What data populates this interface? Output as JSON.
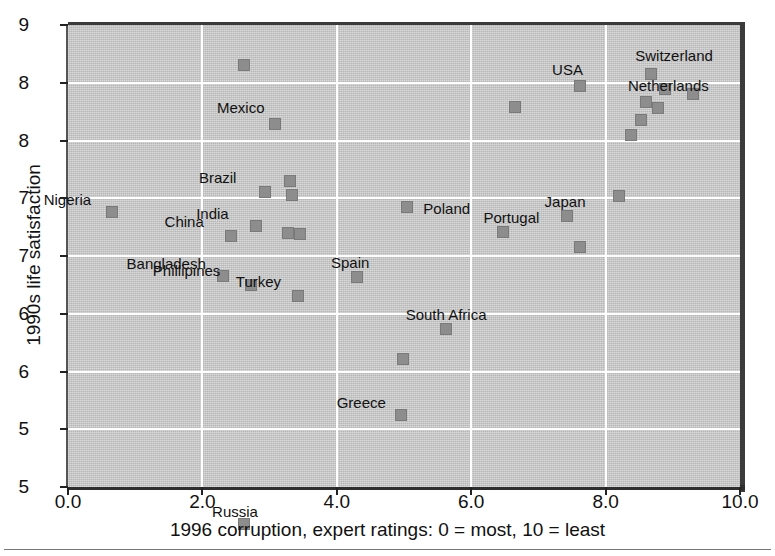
{
  "chart_data": {
    "type": "scatter",
    "title": "",
    "xlabel": "1996 corruption, expert ratings: 0 = most, 10 = least",
    "ylabel": "1990s life satisfaction",
    "xlim": [
      0.0,
      10.0
    ],
    "ylim": [
      5.0,
      9.0
    ],
    "grid": true,
    "legend": "none",
    "xticks": [
      "0.0",
      "2.0",
      "4.0",
      "6.0",
      "8.0",
      "10.0"
    ],
    "xtick_values": [
      0.0,
      2.0,
      4.0,
      6.0,
      8.0,
      10.0
    ],
    "yticks": [
      "9",
      "8",
      "8",
      "7",
      "7",
      "6",
      "6",
      "5",
      "5"
    ],
    "ytick_values": [
      9.0,
      8.5,
      8.0,
      7.5,
      7.0,
      6.5,
      6.0,
      5.5,
      5.0
    ],
    "marker_color": "#8d8d8d",
    "plot_background": "#c4c4c4",
    "gridline_color": "#ffffff",
    "points": [
      {
        "label": "Nigeria",
        "x": 0.65,
        "y": 7.38,
        "label_dx": -68,
        "label_dy": -20
      },
      {
        "label": "Bangladesh",
        "x": 2.3,
        "y": 6.83,
        "label_dx": -96,
        "label_dy": -20
      },
      {
        "label": "China",
        "x": 2.42,
        "y": 7.17,
        "label_dx": -66,
        "label_dy": -22
      },
      {
        "label": "",
        "x": 2.62,
        "y": 8.65,
        "label_dx": 0,
        "label_dy": 0
      },
      {
        "label": "Russia",
        "x": 2.62,
        "y": 4.68,
        "label_dx": -32,
        "label_dy": -20
      },
      {
        "label": "Phillipines",
        "x": 2.72,
        "y": 6.75,
        "label_dx": -98,
        "label_dy": -22
      },
      {
        "label": "India",
        "x": 2.8,
        "y": 7.26,
        "label_dx": -60,
        "label_dy": -20
      },
      {
        "label": "Brazil",
        "x": 2.93,
        "y": 7.55,
        "label_dx": -66,
        "label_dy": -22
      },
      {
        "label": "Mexico",
        "x": 3.08,
        "y": 8.14,
        "label_dx": -58,
        "label_dy": -24
      },
      {
        "label": "",
        "x": 3.28,
        "y": 7.2,
        "label_dx": 0,
        "label_dy": 0
      },
      {
        "label": "",
        "x": 3.3,
        "y": 7.65,
        "label_dx": 0,
        "label_dy": 0
      },
      {
        "label": "",
        "x": 3.33,
        "y": 7.53,
        "label_dx": 0,
        "label_dy": 0
      },
      {
        "label": "Turkey",
        "x": 3.42,
        "y": 6.65,
        "label_dx": -62,
        "label_dy": -22
      },
      {
        "label": "",
        "x": 3.45,
        "y": 7.19,
        "label_dx": 0,
        "label_dy": 0
      },
      {
        "label": "Spain",
        "x": 4.3,
        "y": 6.82,
        "label_dx": -26,
        "label_dy": -22
      },
      {
        "label": "Greece",
        "x": 4.95,
        "y": 5.62,
        "label_dx": -64,
        "label_dy": -20
      },
      {
        "label": "",
        "x": 4.98,
        "y": 6.11,
        "label_dx": 0,
        "label_dy": 0
      },
      {
        "label": "Poland",
        "x": 5.05,
        "y": 7.42,
        "label_dx": 16,
        "label_dy": -6
      },
      {
        "label": "South Africa",
        "x": 5.62,
        "y": 6.37,
        "label_dx": -40,
        "label_dy": -22
      },
      {
        "label": "Portugal",
        "x": 6.48,
        "y": 7.21,
        "label_dx": -20,
        "label_dy": -22
      },
      {
        "label": "",
        "x": 6.65,
        "y": 8.29,
        "label_dx": 0,
        "label_dy": 0
      },
      {
        "label": "Japan",
        "x": 7.42,
        "y": 7.35,
        "label_dx": -22,
        "label_dy": -22
      },
      {
        "label": "",
        "x": 7.62,
        "y": 7.08,
        "label_dx": 0,
        "label_dy": 0
      },
      {
        "label": "USA",
        "x": 7.62,
        "y": 8.47,
        "label_dx": -28,
        "label_dy": -24
      },
      {
        "label": "",
        "x": 8.2,
        "y": 7.52,
        "label_dx": 0,
        "label_dy": 0
      },
      {
        "label": "",
        "x": 8.38,
        "y": 8.05,
        "label_dx": 0,
        "label_dy": 0
      },
      {
        "label": "",
        "x": 8.52,
        "y": 8.18,
        "label_dx": 0,
        "label_dy": 0
      },
      {
        "label": "Netherlands",
        "x": 8.6,
        "y": 8.33,
        "label_dx": -18,
        "label_dy": -24
      },
      {
        "label": "Switzerland",
        "x": 8.68,
        "y": 8.58,
        "label_dx": -16,
        "label_dy": -26
      },
      {
        "label": "",
        "x": 8.78,
        "y": 8.28,
        "label_dx": 0,
        "label_dy": 0
      },
      {
        "label": "",
        "x": 8.88,
        "y": 8.45,
        "label_dx": 0,
        "label_dy": 0
      },
      {
        "label": "",
        "x": 9.3,
        "y": 8.4,
        "label_dx": 0,
        "label_dy": 0
      }
    ]
  }
}
